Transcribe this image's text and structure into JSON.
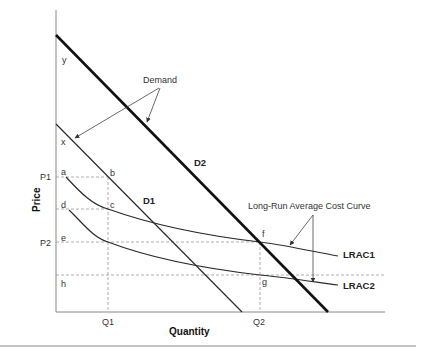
{
  "diagram": {
    "axes": {
      "x_title": "Quantity",
      "y_title": "Price",
      "x_ticks": [
        "Q1",
        "Q2"
      ],
      "y_ticks": [
        "P1",
        "P2"
      ]
    },
    "curves": {
      "d1": "D1",
      "d2": "D2",
      "lrac1": "LRAC1",
      "lrac2": "LRAC2"
    },
    "points": {
      "y": "y",
      "x": "x",
      "a": "a",
      "b": "b",
      "c": "c",
      "d": "d",
      "e": "e",
      "f": "f",
      "g": "g",
      "h": "h"
    },
    "annotations": {
      "demand": "Demand",
      "lrac": "Long-Run Average Cost Curve"
    },
    "colors": {
      "line": "#2a2a2a",
      "dashed": "#999999",
      "axis": "#888888"
    }
  }
}
